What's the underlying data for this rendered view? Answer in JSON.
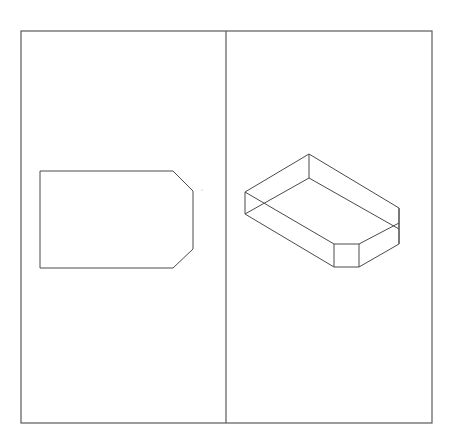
{
  "diagram": {
    "type": "technical-drawing",
    "panels": [
      {
        "name": "2d-view",
        "description": "Top-view of a rectangle with two chamfered corners on the right side"
      },
      {
        "name": "isometric-view",
        "description": "Isometric view of a chamfered rectangular block"
      }
    ],
    "colors": {
      "background": "#ffffff",
      "line": "#4a4a4a",
      "frame": "#5a5a5a"
    },
    "frame": {
      "x1": 21,
      "y1": 31,
      "x2": 432,
      "y2": 423,
      "divider_x": 226
    },
    "shape_2d": {
      "points": "40,171 173,171 193,191 193,249 173,268 40,268"
    },
    "shape_3d": {
      "top_face": "309,154 399,208 399,223 359,244 334,244 245,192",
      "bottom_edges": [
        "245,214 334,267 359,267 399,244 399,223",
        "245,192 245,214",
        "334,244 334,267",
        "359,244 359,267",
        "399,208 399,244",
        "309,154 309,178",
        "245,214 309,178 399,229"
      ]
    },
    "stray_dot": {
      "x": 202,
      "y": 190
    }
  }
}
